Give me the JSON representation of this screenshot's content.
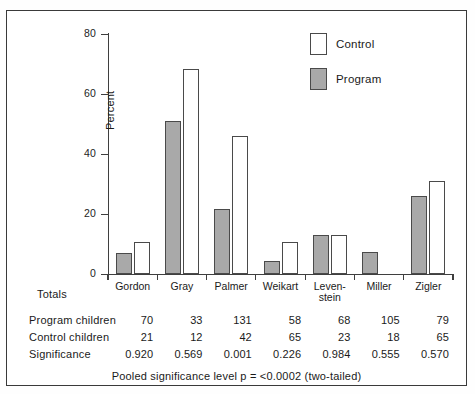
{
  "chart_data": {
    "type": "bar",
    "title": "",
    "xlabel": "",
    "ylabel": "Percent",
    "ylim": [
      0,
      80
    ],
    "yticks": [
      0,
      20,
      40,
      60,
      80
    ],
    "grid": false,
    "legend_position": "top-right",
    "categories": [
      "Gordon",
      "Gray",
      "Palmer",
      "Weikart",
      "Leven-\nstein",
      "Miller",
      "Zigler"
    ],
    "series": [
      {
        "name": "Program",
        "values": [
          7,
          51,
          21.7,
          4.3,
          13,
          7.3,
          26
        ]
      },
      {
        "name": "Control",
        "values": [
          10.7,
          68.3,
          46,
          10.7,
          13,
          0,
          31
        ]
      }
    ]
  },
  "legend": {
    "items": [
      {
        "label": "Control",
        "style": "control"
      },
      {
        "label": "Program",
        "style": "program"
      }
    ]
  },
  "axis": {
    "ylabel": "Percent",
    "ticks": [
      "80",
      "60",
      "40",
      "20",
      "0"
    ]
  },
  "categories": [
    {
      "line1": "Gordon",
      "line2": ""
    },
    {
      "line1": "Gray",
      "line2": ""
    },
    {
      "line1": "Palmer",
      "line2": ""
    },
    {
      "line1": "Weikart",
      "line2": ""
    },
    {
      "line1": "Leven-",
      "line2": "stein"
    },
    {
      "line1": "Miller",
      "line2": ""
    },
    {
      "line1": "Zigler",
      "line2": ""
    }
  ],
  "table": {
    "corner_label": "Totals",
    "rows": [
      {
        "label": "Program children",
        "values": [
          "70",
          "33",
          "131",
          "58",
          "68",
          "105",
          "79"
        ]
      },
      {
        "label": "Control children",
        "values": [
          "21",
          "12",
          "42",
          "65",
          "23",
          "18",
          "65"
        ]
      },
      {
        "label": "Significance",
        "values": [
          "0.920",
          "0.569",
          "0.001",
          "0.226",
          "0.984",
          "0.555",
          "0.570"
        ]
      }
    ]
  },
  "footnote": "Pooled significance level p  =  <0.0002 (two-tailed)",
  "colors": {
    "program_fill": "#a9a9a9",
    "control_fill": "#ffffff",
    "outline": "#4a4a4a",
    "axis": "#3f3f3f",
    "frame": "#3a3a3a",
    "text": "#1a1a1a"
  }
}
